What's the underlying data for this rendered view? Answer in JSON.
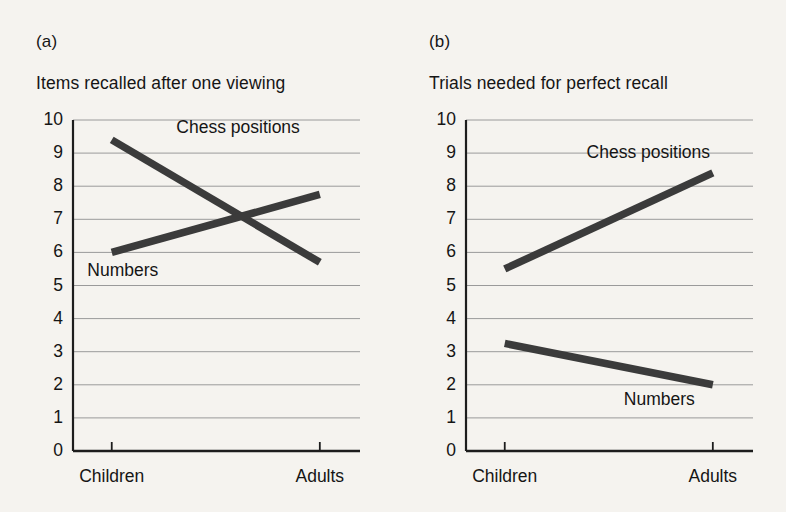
{
  "figure": {
    "background_color": "#f5f3ef",
    "line_color": "#3b3b3b",
    "grid_color": "#9a9a9a",
    "axis_color": "#1d1d1d"
  },
  "chart_data": [
    {
      "type": "line",
      "panel_tag": "(a)",
      "title": "Items recalled after one viewing",
      "xlabel": "",
      "ylabel": "",
      "categories": [
        "Children",
        "Adults"
      ],
      "x": [
        0,
        1
      ],
      "ylim": [
        0,
        10
      ],
      "yticks": [
        0,
        1,
        2,
        3,
        4,
        5,
        6,
        7,
        8,
        9,
        10
      ],
      "ytick_labels": [
        "0",
        "1",
        "2",
        "3",
        "4",
        "5",
        "6",
        "7",
        "8",
        "9",
        "10"
      ],
      "grid": true,
      "legend_position": "inline-annotation",
      "series": [
        {
          "name": "Chess positions",
          "values": [
            9.4,
            5.7
          ],
          "label_x_fraction": 0.36,
          "label_y_value": 9.75
        },
        {
          "name": "Numbers",
          "values": [
            6.0,
            7.75
          ],
          "label_x_fraction": 0.05,
          "label_y_value": 5.45
        }
      ]
    },
    {
      "type": "line",
      "panel_tag": "(b)",
      "title": "Trials needed for perfect recall",
      "xlabel": "",
      "ylabel": "",
      "categories": [
        "Children",
        "Adults"
      ],
      "x": [
        0,
        1
      ],
      "ylim": [
        0,
        10
      ],
      "yticks": [
        0,
        1,
        2,
        3,
        4,
        5,
        6,
        7,
        8,
        9,
        10
      ],
      "ytick_labels": [
        "0",
        "1",
        "2",
        "3",
        "4",
        "5",
        "6",
        "7",
        "8",
        "9",
        "10"
      ],
      "grid": true,
      "legend_position": "inline-annotation",
      "series": [
        {
          "name": "Chess positions",
          "values": [
            5.5,
            8.4
          ],
          "label_x_fraction": 0.42,
          "label_y_value": 9.0
        },
        {
          "name": "Numbers",
          "values": [
            3.25,
            2.0
          ],
          "label_x_fraction": 0.55,
          "label_y_value": 1.55
        }
      ]
    }
  ]
}
